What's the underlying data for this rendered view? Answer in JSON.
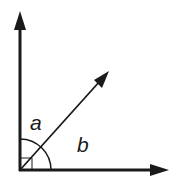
{
  "diagram": {
    "labels": {
      "angle_a": "a",
      "angle_b": "b"
    },
    "colors": {
      "stroke": "#1a1a1a",
      "background": "#ffffff"
    },
    "elements": {
      "origin": [
        20,
        170
      ],
      "vertical_arrow_tip": [
        20,
        12
      ],
      "horizontal_arrow_tip": [
        168,
        170
      ],
      "diagonal_arrow_tip": [
        109,
        71
      ],
      "arc_radius": 31,
      "right_angle_marker_size": 12
    }
  }
}
